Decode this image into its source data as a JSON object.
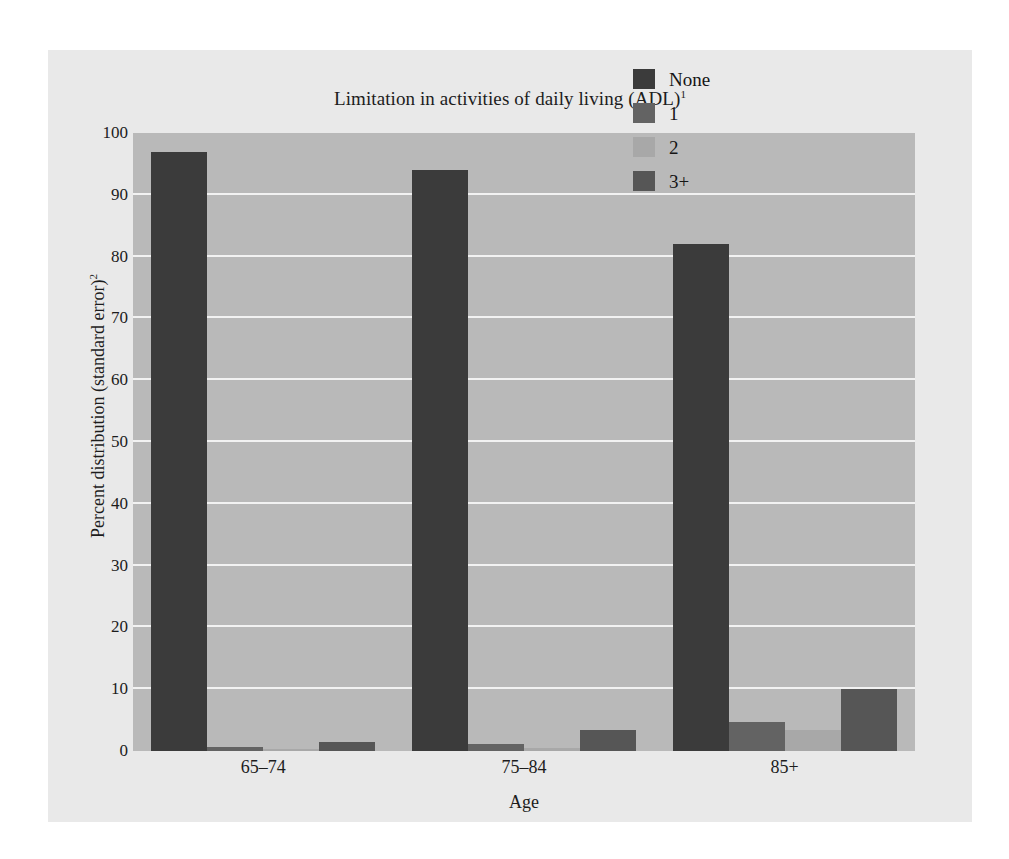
{
  "chart_data": {
    "type": "bar",
    "title": "Limitation in activities of daily living (ADL)",
    "title_superscript": "1",
    "subtitle": "",
    "xlabel": "Age",
    "ylabel": "Percent distribution (standard error)",
    "ylabel_superscript": "2",
    "categories": [
      "65–74",
      "75–84",
      "85+"
    ],
    "ylim": [
      0,
      100
    ],
    "yticks": [
      0,
      10,
      20,
      30,
      40,
      50,
      60,
      70,
      80,
      90,
      100
    ],
    "ytick_labels": [
      "0",
      "10",
      "20",
      "30",
      "40",
      "50",
      "60",
      "70",
      "80",
      "90",
      "100"
    ],
    "grid": true,
    "grid_axis": "y",
    "legend_position": "top-right",
    "series": [
      {
        "name": "None",
        "color": "#3b3b3b",
        "values": [
          97.0,
          94.0,
          82.0
        ]
      },
      {
        "name": "1",
        "color": "#636363",
        "values": [
          0.7,
          1.2,
          4.7
        ]
      },
      {
        "name": "2",
        "color": "#a8a8a8",
        "values": [
          0.3,
          0.5,
          3.4
        ]
      },
      {
        "name": "3+",
        "color": "#565656",
        "values": [
          1.5,
          3.4,
          10.0
        ]
      }
    ]
  },
  "legend": {
    "entries": [
      {
        "label": "None",
        "color": "#3b3b3b"
      },
      {
        "label": "1",
        "color": "#636363"
      },
      {
        "label": "2",
        "color": "#a8a8a8"
      },
      {
        "label": "3+",
        "color": "#565656"
      }
    ]
  },
  "colors": {
    "page_background": "#ffffff",
    "figure_background": "#e9e9e9",
    "plot_background": "#b9b9b9",
    "gridline": "#f2f2f2",
    "text": "#1c1c1c"
  }
}
